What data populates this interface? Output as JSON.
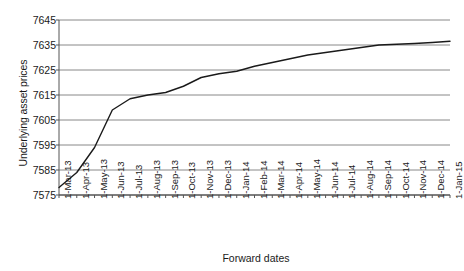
{
  "chart_data": {
    "type": "line",
    "title": "",
    "xlabel": "Forward dates",
    "ylabel": "Underlying asset prices",
    "ylim": [
      7575,
      7645
    ],
    "ytick_labels": [
      "7645",
      "7635",
      "7625",
      "7615",
      "7605",
      "7595",
      "7585",
      "7575"
    ],
    "ytick_values": [
      7645,
      7635,
      7625,
      7615,
      7605,
      7595,
      7585,
      7575
    ],
    "grid": "horizontal",
    "legend": "none",
    "line_color": "#1a1a1a",
    "categories": [
      "1-Mar-13",
      "1-Apr-13",
      "1-May-13",
      "1-Jun-13",
      "1-Jul-13",
      "1-Aug-13",
      "1-Sep-13",
      "1-Oct-13",
      "1-Nov-13",
      "1-Dec-13",
      "1-Jan-14",
      "1-Feb-14",
      "1-Mar-14",
      "1-Apr-14",
      "1-May-14",
      "1-Jun-14",
      "1-Jul-14",
      "1-Aug-14",
      "1-Sep-14",
      "1-Oct-14",
      "1-Nov-14",
      "1-Dec-14",
      "1-Jan-15"
    ],
    "values": [
      7578.0,
      7584.0,
      7594.0,
      7609.0,
      7613.5,
      7615.0,
      7616.0,
      7618.5,
      7622.0,
      7623.5,
      7624.5,
      7626.5,
      7628.0,
      7629.5,
      7631.0,
      7632.0,
      7633.0,
      7634.0,
      7635.0,
      7635.3,
      7635.6,
      7636.0,
      7636.5
    ],
    "series": [
      {
        "name": "Underlying asset prices",
        "values": [
          7578.0,
          7584.0,
          7594.0,
          7609.0,
          7613.5,
          7615.0,
          7616.0,
          7618.5,
          7622.0,
          7623.5,
          7624.5,
          7626.5,
          7628.0,
          7629.5,
          7631.0,
          7632.0,
          7633.0,
          7634.0,
          7635.0,
          7635.3,
          7635.6,
          7636.0,
          7636.5
        ]
      }
    ]
  }
}
